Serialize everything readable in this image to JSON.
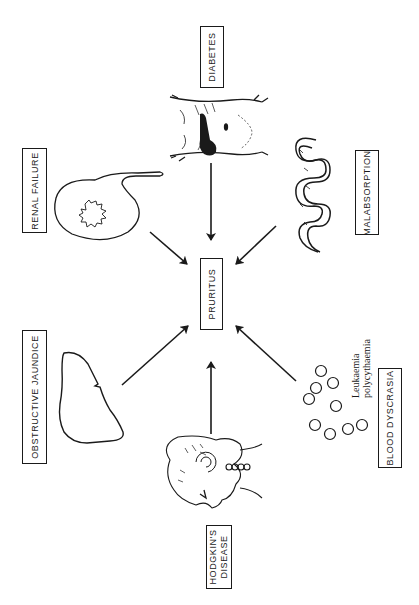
{
  "diagram": {
    "center": {
      "label": "PRURITUS"
    },
    "causes": [
      {
        "id": "diabetes",
        "label": "DIABETES",
        "illustration": "abdomen-with-pancreas"
      },
      {
        "id": "renal-failure",
        "label": "RENAL FAILURE",
        "illustration": "kidney"
      },
      {
        "id": "malabsorption",
        "label": "MALABSORPTION",
        "illustration": "small-intestine"
      },
      {
        "id": "obstructive-jaundice",
        "label": "OBSTRUCTIVE JAUNDICE",
        "illustration": "liver"
      },
      {
        "id": "hodgkins-disease",
        "label_line1": "HODGKIN'S",
        "label_line2": "DISEASE",
        "illustration": "head-with-lymph-nodes"
      },
      {
        "id": "blood-dyscrasia",
        "label": "BLOOD DYSCRASIA",
        "illustration": "blood-cells"
      }
    ],
    "annotations": {
      "blood_line1": "Leukaemia",
      "blood_line2": "polycythaemia"
    },
    "colors": {
      "ink": "#1a1a1a",
      "background": "#ffffff"
    }
  }
}
